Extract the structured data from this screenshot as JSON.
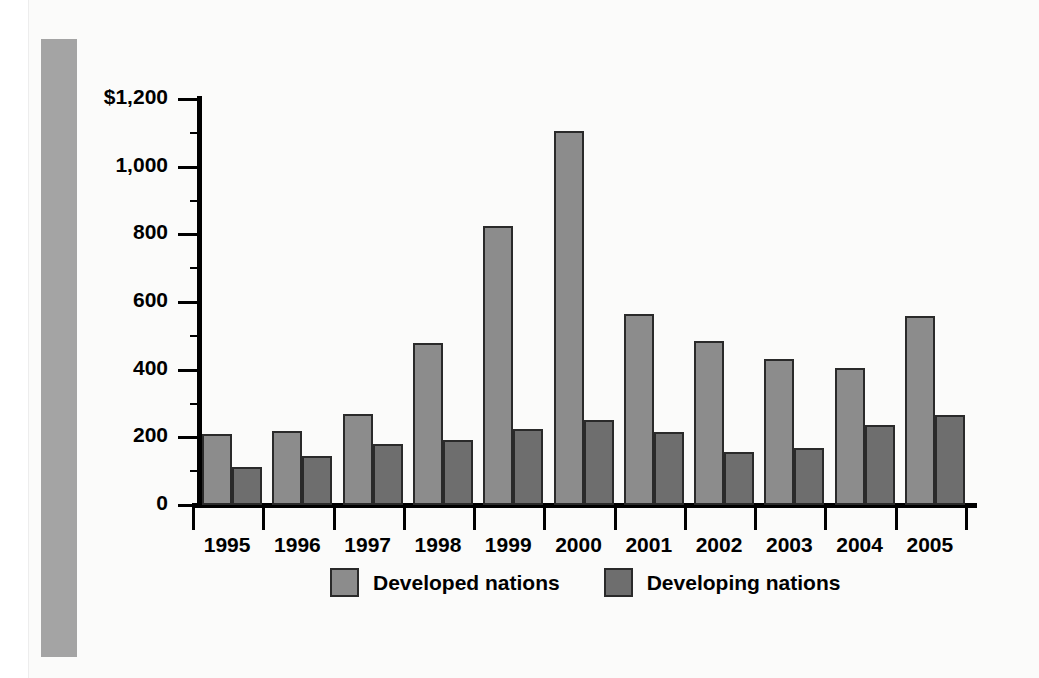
{
  "chart_data": {
    "type": "bar",
    "title": "",
    "subtitle": "",
    "xlabel": "",
    "ylabel": "",
    "ylim": [
      0,
      1200
    ],
    "ytick_values": [
      0,
      200,
      400,
      600,
      800,
      1000,
      1200
    ],
    "ytick_labels": [
      "0",
      "200",
      "400",
      "600",
      "800",
      "1,000",
      "$1,200"
    ],
    "grid": false,
    "legend_position": "bottom",
    "categories": [
      "1995",
      "1996",
      "1997",
      "1998",
      "1999",
      "2000",
      "2001",
      "2002",
      "2003",
      "2004",
      "2005"
    ],
    "series": [
      {
        "name": "Developed nations",
        "color": "#8c8c8c",
        "values": [
          210,
          220,
          270,
          478,
          825,
          1105,
          565,
          485,
          432,
          405,
          560
        ]
      },
      {
        "name": "Developing nations",
        "color": "#6e6e6e",
        "values": [
          112,
          145,
          180,
          192,
          225,
          252,
          217,
          158,
          167,
          237,
          267
        ]
      }
    ]
  },
  "legend": {
    "items": [
      {
        "label": "Developed nations",
        "color": "#8c8c8c"
      },
      {
        "label": "Developing nations",
        "color": "#6e6e6e"
      }
    ]
  },
  "colors": {
    "side_band": "#a4a4a4",
    "plate_background": "#fbfbfa",
    "axis": "#000000",
    "bar_outline": "#2a2a2a"
  }
}
